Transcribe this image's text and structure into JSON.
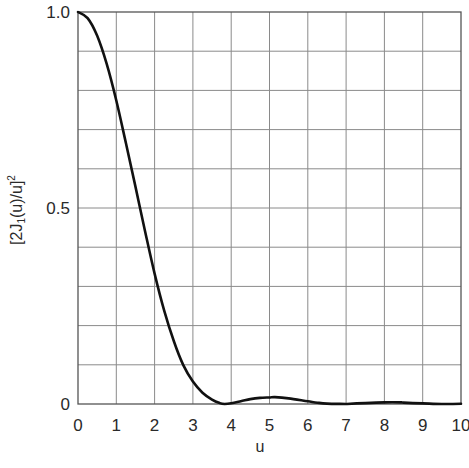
{
  "chart_data": {
    "type": "line",
    "title": "",
    "xlabel": "u",
    "ylabel": "[2J₁(u)/u]²",
    "xlim": [
      0,
      10
    ],
    "ylim": [
      0,
      1.0
    ],
    "grid": true,
    "legend": null,
    "x_ticks": [
      "0",
      "1",
      "2",
      "3",
      "4",
      "5",
      "6",
      "7",
      "8",
      "9",
      "10"
    ],
    "y_ticks": [
      "0",
      "0.5",
      "1.0"
    ],
    "y_gridlines": 10,
    "x_gridlines": 10,
    "series": [
      {
        "name": "[2J₁(u)/u]²",
        "color": "#111111",
        "x": [
          0,
          0.25,
          0.5,
          0.75,
          1,
          1.25,
          1.5,
          1.75,
          2,
          2.25,
          2.5,
          2.75,
          3,
          3.25,
          3.5,
          3.7,
          3.83,
          4,
          4.25,
          4.5,
          4.75,
          5,
          5.14,
          5.5,
          6,
          6.25,
          6.5,
          7,
          7.02,
          7.5,
          8,
          8.42,
          8.5,
          9,
          9.5,
          10
        ],
        "values": [
          1.0,
          0.9845,
          0.9393,
          0.8676,
          0.7743,
          0.6657,
          0.555,
          0.4413,
          0.3326,
          0.2382,
          0.1608,
          0.0993,
          0.0571,
          0.0289,
          0.0112,
          0.0022,
          0.0,
          0.00175,
          0.0068,
          0.0124,
          0.0155,
          0.0167,
          0.0175,
          0.0142,
          0.0068,
          0.0033,
          0.0011,
          0.0001,
          0.0,
          0.0024,
          0.0042,
          0.0042,
          0.0036,
          0.0015,
          0.0001,
          0.0004
        ]
      }
    ]
  },
  "axes": {
    "x_label": "u",
    "y_label_main": "[2J",
    "y_label_sub": "1",
    "y_label_rest": "(u)/u]",
    "y_label_sup": "2"
  }
}
